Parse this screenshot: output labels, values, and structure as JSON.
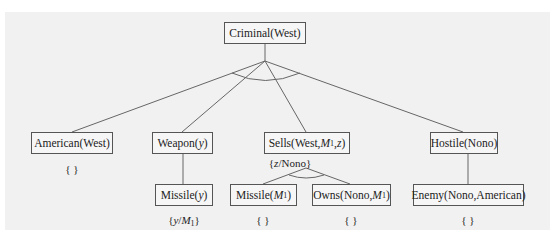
{
  "diagram": {
    "type": "and-or proof tree (backward chaining)",
    "root": {
      "label": "Criminal(West)"
    },
    "level1": [
      {
        "pre": "American(West)",
        "subst": "{ }"
      },
      {
        "pre": "Weapon(",
        "var": "y",
        "post": ")",
        "subst": ""
      },
      {
        "pre": "Sells(West,",
        "var": "M",
        "sub": "1",
        "post2": ",",
        "var2": "z",
        "post": ")",
        "subst_pre": "{",
        "subst_var": "z",
        "subst_post": "/Nono}"
      },
      {
        "pre": "Hostile(Nono)",
        "subst": ""
      }
    ],
    "level2": [
      {
        "pre": "Missile(",
        "var": "y",
        "post": ")",
        "subst_pre": "{",
        "subst_var": "y",
        "subst_mid": "/",
        "subst_var2": "M",
        "subst_sub": "1",
        "subst_post": "}"
      },
      {
        "pre": "Missile(",
        "var": "M",
        "sub": "1",
        "post": ")",
        "subst": "{ }"
      },
      {
        "pre": "Owns(Nono,",
        "var": "M",
        "sub": "1",
        "post": ")",
        "subst": "{ }"
      },
      {
        "pre": "Enemy(Nono,American)",
        "subst": "{ }"
      }
    ],
    "colors": {
      "panel": "#f1f1f1",
      "border": "#555555",
      "edge": "#666666"
    }
  }
}
